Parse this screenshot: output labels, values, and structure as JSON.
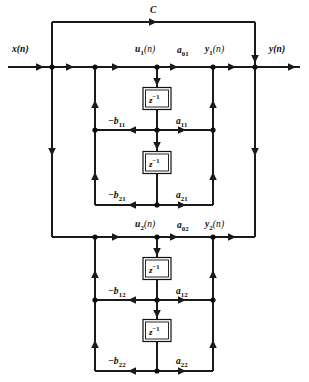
{
  "figure": {
    "type": "signal-flow-diagram"
  },
  "signals": {
    "input": "x(n)",
    "output": "y(n)",
    "feedforward_gain": "C"
  },
  "section1": {
    "state_node": "u",
    "state_node_sub": "1",
    "state_node_suffix": "(n)",
    "output_node": "y",
    "output_node_sub": "1",
    "output_node_suffix": "(n)",
    "numerator_0": "a",
    "numerator_0_sub": "01",
    "numerator_1": "a",
    "numerator_1_sub": "11",
    "numerator_2": "a",
    "numerator_2_sub": "21",
    "denominator_1": "−b",
    "denominator_1_sub": "11",
    "denominator_2": "−b",
    "denominator_2_sub": "21",
    "delay_label": "z",
    "delay_exponent": "−1"
  },
  "section2": {
    "state_node": "u",
    "state_node_sub": "2",
    "state_node_suffix": "(n)",
    "output_node": "y",
    "output_node_sub": "2",
    "output_node_suffix": "(n)",
    "numerator_0": "a",
    "numerator_0_sub": "02",
    "numerator_1": "a",
    "numerator_1_sub": "12",
    "numerator_2": "a",
    "numerator_2_sub": "22",
    "denominator_1": "−b",
    "denominator_1_sub": "12",
    "denominator_2": "−b",
    "denominator_2_sub": "22",
    "delay_label": "z",
    "delay_exponent": "−1"
  },
  "colors": {
    "line": "#1a1a1a",
    "text": "#0a0a0a",
    "background": "#ffffff"
  }
}
